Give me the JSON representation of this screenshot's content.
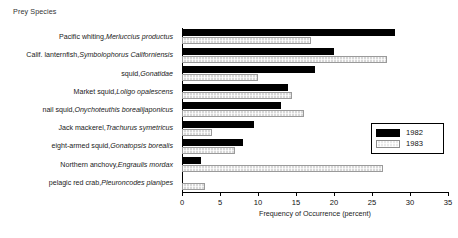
{
  "chart_data": {
    "type": "bar",
    "orientation": "horizontal",
    "title": "Prey Species",
    "xlabel": "Frequency of Occurrence (percent)",
    "ylabel": "",
    "xlim": [
      0,
      35
    ],
    "xticks": [
      0,
      5,
      10,
      15,
      20,
      25,
      30,
      35
    ],
    "grid": false,
    "legend_position": "right",
    "categories": [
      "Pacific whiting, Merluccius productus",
      "Calif. lanternfish, Symbolophorus Californiensis",
      "squid, Gonatidae",
      "Market squid, Loligo opalescens",
      "nail squid, Onychoteuthis borealijaponicus",
      "Jack mackerel, Trachurus symetricus",
      "eight-armed squid, Gonatopsis borealis",
      "Northern anchovy, Engraulis mordax",
      "pelagic red crab, Pleuroncodes planipes"
    ],
    "category_parts": [
      {
        "common": "Pacific whiting,",
        "scientific": "Merluccius productus"
      },
      {
        "common": "Calif. lanternfish,",
        "scientific": "Symbolophorus Californiensis"
      },
      {
        "common": "squid,",
        "scientific": "Gonatidae"
      },
      {
        "common": "Market squid,",
        "scientific": "Loligo opalescens"
      },
      {
        "common": "nail squid,",
        "scientific": "Onychoteuthis borealijaponicus"
      },
      {
        "common": "Jack mackerel,",
        "scientific": "Trachurus symetricus"
      },
      {
        "common": "eight-armed squid,",
        "scientific": "Gonatopsis borealis"
      },
      {
        "common": "Northern anchovy,",
        "scientific": "Engraulis mordax"
      },
      {
        "common": "pelagic red crab,",
        "scientific": "Pleuroncodes planipes"
      }
    ],
    "series": [
      {
        "name": "1982",
        "color": "#000000",
        "values": [
          28.0,
          20.0,
          17.5,
          14.0,
          13.0,
          9.5,
          8.0,
          2.5,
          0.0
        ]
      },
      {
        "name": "1983",
        "color": "#d8d8d8",
        "values": [
          17.0,
          27.0,
          10.0,
          14.5,
          16.0,
          4.0,
          7.0,
          26.5,
          3.0
        ]
      }
    ]
  },
  "legend": {
    "items": [
      {
        "label": "1982"
      },
      {
        "label": "1983"
      }
    ]
  }
}
